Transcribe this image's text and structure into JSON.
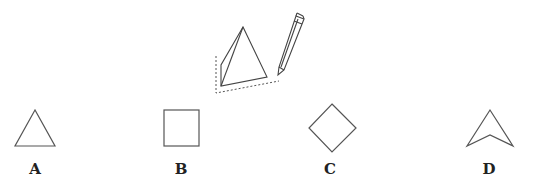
{
  "illustration": {
    "description": "triangular pyramid placed on paper, being traced with a pencil",
    "icon": "pyramid-with-pencil"
  },
  "options": [
    {
      "label": "A",
      "shape": "triangle"
    },
    {
      "label": "B",
      "shape": "square"
    },
    {
      "label": "C",
      "shape": "diamond"
    },
    {
      "label": "D",
      "shape": "arrowhead"
    }
  ],
  "colors": {
    "stroke": "#555555",
    "label": "#222222"
  }
}
